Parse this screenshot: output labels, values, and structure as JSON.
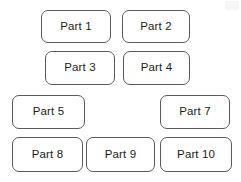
{
  "diagram": {
    "background_color": "#ffffff",
    "border_color": "#5a5a5a",
    "text_color": "#1c1c1c",
    "canvas": {
      "width": 241,
      "height": 182
    },
    "rows": [
      {
        "row_label": "row-1",
        "boxes": [
          {
            "label": "Part 1",
            "x": 41,
            "y": 10,
            "width": 70,
            "height": 33
          },
          {
            "label": "Part 2",
            "x": 122,
            "y": 10,
            "width": 68,
            "height": 33
          }
        ]
      },
      {
        "row_label": "row-2",
        "boxes": [
          {
            "label": "Part 3",
            "x": 45,
            "y": 51,
            "width": 70,
            "height": 34
          },
          {
            "label": "Part 4",
            "x": 123,
            "y": 51,
            "width": 67,
            "height": 34
          }
        ]
      },
      {
        "row_label": "row-3",
        "boxes": [
          {
            "label": "Part 5",
            "x": 12,
            "y": 95,
            "width": 73,
            "height": 34
          },
          {
            "label": "Part 7",
            "x": 160,
            "y": 95,
            "width": 70,
            "height": 34
          }
        ]
      },
      {
        "row_label": "row-4",
        "boxes": [
          {
            "label": "Part 8",
            "x": 12,
            "y": 137,
            "width": 71,
            "height": 35
          },
          {
            "label": "Part 9",
            "x": 86,
            "y": 137,
            "width": 69,
            "height": 35
          },
          {
            "label": "Part 10",
            "x": 160,
            "y": 137,
            "width": 72,
            "height": 35
          }
        ]
      }
    ]
  }
}
